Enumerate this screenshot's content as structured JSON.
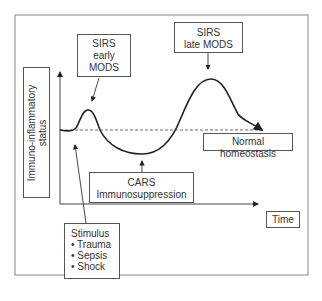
{
  "diagram": {
    "y_axis_label": [
      "Immuno-inflammatory",
      "status"
    ],
    "x_axis_label": "Time",
    "sirs_early": {
      "lines": [
        "SIRS",
        "early",
        "MODS"
      ]
    },
    "sirs_late": {
      "lines": [
        "SIRS",
        "late MODS"
      ]
    },
    "normal": {
      "label": "Normal homeostasis"
    },
    "cars": {
      "lines": [
        "CARS",
        "Immunosuppression"
      ]
    },
    "stimulus": {
      "title": "Stimulus",
      "items": [
        "• Trauma",
        "• Sepsis",
        "• Shock"
      ]
    },
    "colors": {
      "line": "#222222",
      "border": "#555555",
      "text": "#333333"
    }
  }
}
